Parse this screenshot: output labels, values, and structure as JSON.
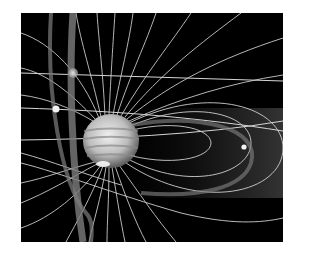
{
  "illustration": {
    "subject": "Jupiter magnetosphere illustration",
    "palette": {
      "background": "#ffffff",
      "space": "#000000",
      "field_line": "#cfcfcf",
      "orbit_band": "#8a8a8a",
      "planet_light": "#e6e6e6",
      "planet_dark": "#7a7a7a"
    },
    "elements": {
      "planet": "jupiter",
      "moons": [
        "moon-upper",
        "moon-left",
        "moon-right"
      ],
      "torus": "plasma-torus"
    }
  }
}
